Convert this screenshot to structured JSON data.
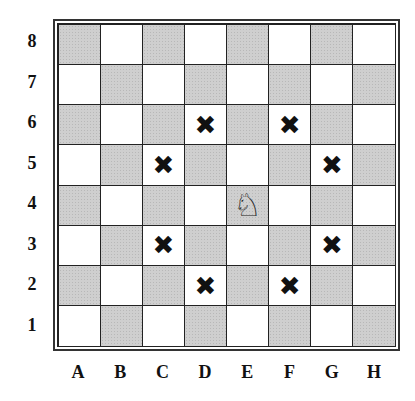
{
  "diagram": {
    "ranks": [
      "8",
      "7",
      "6",
      "5",
      "4",
      "3",
      "2",
      "1"
    ],
    "files": [
      "A",
      "B",
      "C",
      "D",
      "E",
      "F",
      "G",
      "H"
    ],
    "piece": {
      "name": "knight",
      "glyph": "♘",
      "square": "E4"
    },
    "marked_squares": [
      "D6",
      "F6",
      "C5",
      "G5",
      "C3",
      "G3",
      "D2",
      "F2"
    ],
    "mark_glyph": "✖",
    "colors": {
      "light": "#ffffff",
      "dark": "#cfcfcf",
      "line": "#222222"
    }
  }
}
